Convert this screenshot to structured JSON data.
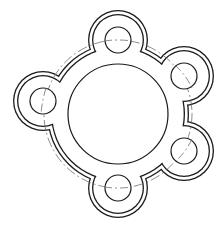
{
  "diagram": {
    "type": "technical-drawing",
    "colors": {
      "line": "#1a1a1a",
      "centerline": "#6e6e6e",
      "background": "#ffffff"
    },
    "center": [
      118,
      114
    ],
    "bore": {
      "radius": 50
    },
    "bolt_circle": {
      "radius": 74,
      "style": "dash-dot"
    },
    "body": {
      "outer_radius": 71,
      "inner_radius": 67
    },
    "lobes": {
      "outer_radius": 30,
      "inner_radius": 26
    },
    "holes": [
      {
        "id": "top",
        "cx": 118,
        "cy": 40,
        "r": 13
      },
      {
        "id": "upper-right",
        "cx": 184,
        "cy": 76,
        "r": 13
      },
      {
        "id": "lower-right",
        "cx": 184,
        "cy": 151,
        "r": 13
      },
      {
        "id": "bottom",
        "cx": 118,
        "cy": 188,
        "r": 13
      },
      {
        "id": "left",
        "cx": 43,
        "cy": 101,
        "r": 13
      }
    ]
  }
}
